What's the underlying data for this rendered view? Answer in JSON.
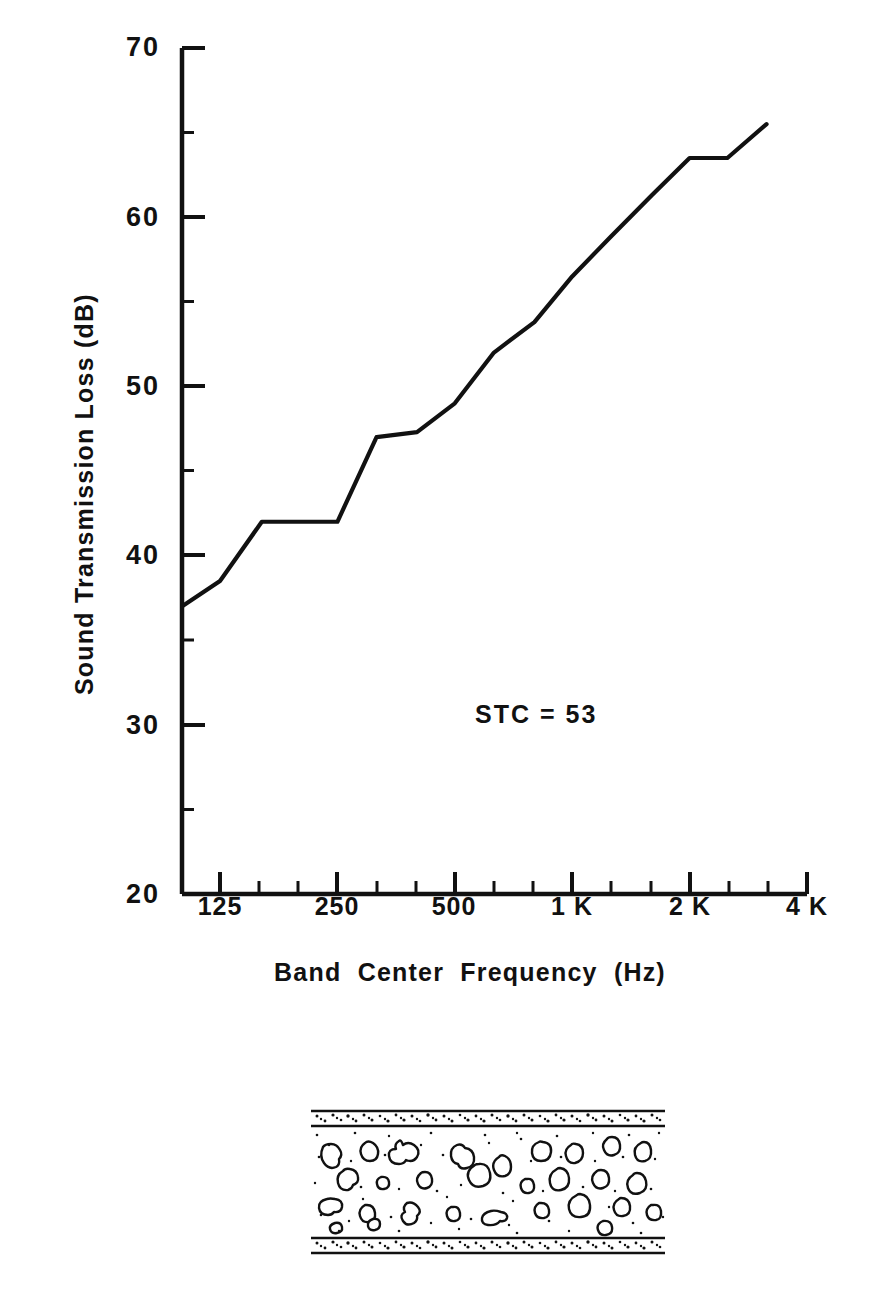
{
  "figure": {
    "top_note": "",
    "annotation": "STC = 53"
  },
  "axes": {
    "y_title": "Sound  Transmission  Loss  (dB)",
    "x_title": "Band  Center  Frequency  (Hz)",
    "y_ticks": [
      "70",
      "60",
      "50",
      "40",
      "30",
      "20"
    ],
    "x_ticks": [
      "125",
      "250",
      "500",
      "1 K",
      "2 K",
      "4 K"
    ]
  },
  "chart_data": {
    "type": "line",
    "title": "",
    "xlabel": "Band Center Frequency (Hz)",
    "ylabel": "Sound Transmission Loss (dB)",
    "xscale": "log",
    "x_tick_values": [
      125,
      250,
      500,
      1000,
      2000,
      4000
    ],
    "x_tick_labels": [
      "125",
      "250",
      "500",
      "1 K",
      "2 K",
      "4 K"
    ],
    "ylim": [
      20,
      70
    ],
    "y_ticks": [
      20,
      30,
      40,
      50,
      60,
      70
    ],
    "grid": false,
    "legend": null,
    "annotations": [
      {
        "text": "STC = 53",
        "x": 500,
        "y": 30.5
      }
    ],
    "series": [
      {
        "name": "Sound Transmission Loss",
        "x": [
          100,
          125,
          160,
          200,
          250,
          315,
          400,
          500,
          630,
          800,
          1000,
          1250,
          1600,
          2000,
          2500,
          3150
        ],
        "values": [
          37.0,
          38.5,
          42.0,
          42.0,
          42.0,
          47.0,
          47.3,
          49.0,
          52.0,
          53.8,
          56.5,
          58.8,
          61.3,
          63.5,
          63.5,
          65.5
        ]
      }
    ]
  },
  "wall_section": {
    "name": "concrete-aggregate-wall-cross-section",
    "description": "Hatched cross-section of a solid aggregate concrete wall with plaster skin coats top and bottom",
    "layers": [
      "plaster-skin-top",
      "aggregate-concrete-core",
      "plaster-skin-bottom"
    ]
  }
}
